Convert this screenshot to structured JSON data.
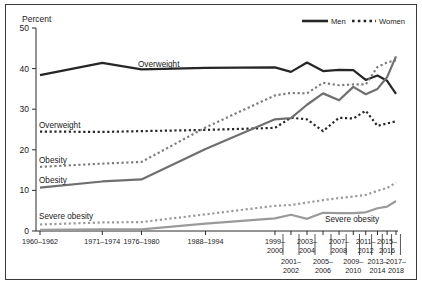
{
  "figure": {
    "y_axis_title": "Percent",
    "legend": [
      {
        "label": "Men",
        "style": "solid",
        "color": "#262626"
      },
      {
        "label": "Women",
        "style": "dotted",
        "color": "#262626"
      }
    ],
    "inline_labels": {
      "men_overweight": "Overweight",
      "women_overweight": "Overweight",
      "women_obesity": "Obesity",
      "men_obesity": "Obesity",
      "women_severe_obesity": "Severe obesity",
      "men_severe_obesity": "Severe obesity"
    }
  },
  "chart_data": {
    "type": "line",
    "title": "",
    "xlabel": "",
    "ylabel": "Percent",
    "ylim": [
      0,
      50
    ],
    "yticks": [
      0,
      10,
      20,
      30,
      40,
      50
    ],
    "grid": false,
    "legend_position": "top-right",
    "categories": [
      "1960–1962",
      "1971–1974",
      "1976–1980",
      "1988–1994",
      "1999–2000",
      "2001–2002",
      "2003–2004",
      "2005–2006",
      "2007–2008",
      "2009–2010",
      "2011–2012",
      "2013–2014",
      "2015–2016",
      "2017–2018"
    ],
    "xtick_labels_top": [
      "1960–1962",
      "1971–1974",
      "1976–1980",
      "1988–1994",
      "1999–2000",
      "2003–2004",
      "2007–2008",
      "2011–2012",
      "2015–2016"
    ],
    "xtick_labels_bottom": [
      "2001–2002",
      "2005–2006",
      "2009–2010",
      "2013–2014",
      "2017–2018"
    ],
    "series": [
      {
        "name": "Men — Overweight",
        "sex": "Men",
        "measure": "Overweight",
        "style": "solid",
        "color": "#262626",
        "values": [
          38.4,
          41.4,
          39.8,
          40.2,
          40.3,
          39.2,
          41.5,
          39.4,
          39.7,
          39.6,
          37.2,
          38.3,
          37.0,
          33.8
        ]
      },
      {
        "name": "Women — Overweight",
        "sex": "Women",
        "measure": "Overweight",
        "style": "dotted",
        "color": "#262626",
        "values": [
          24.5,
          24.4,
          24.6,
          24.9,
          25.4,
          27.9,
          27.5,
          24.6,
          27.9,
          27.7,
          29.6,
          25.9,
          26.5,
          27.0
        ]
      },
      {
        "name": "Women — Obesity",
        "sex": "Women",
        "measure": "Obesity",
        "style": "dotted",
        "color": "#7c7c7c",
        "values": [
          15.8,
          16.6,
          17.0,
          25.5,
          33.4,
          34.0,
          33.9,
          36.5,
          35.9,
          36.1,
          36.1,
          40.4,
          41.5,
          42.1
        ]
      },
      {
        "name": "Men — Obesity",
        "sex": "Men",
        "measure": "Obesity",
        "style": "solid",
        "color": "#6f6f6f",
        "values": [
          10.7,
          12.2,
          12.7,
          20.2,
          27.5,
          27.8,
          31.1,
          33.9,
          32.2,
          35.5,
          33.7,
          35.0,
          37.9,
          43.0
        ]
      },
      {
        "name": "Women — Severe obesity",
        "sex": "Women",
        "measure": "Severe obesity",
        "style": "dotted",
        "color": "#9a9a9a",
        "values": [
          1.6,
          2.1,
          2.2,
          4.1,
          6.2,
          6.4,
          7.0,
          7.6,
          8.1,
          8.5,
          8.9,
          9.9,
          10.6,
          11.9
        ]
      },
      {
        "name": "Men — Severe obesity",
        "sex": "Men",
        "measure": "Severe obesity",
        "style": "solid",
        "color": "#9a9a9a",
        "values": [
          0.3,
          0.4,
          0.4,
          1.8,
          3.1,
          4.0,
          3.0,
          4.5,
          4.4,
          4.4,
          4.6,
          5.6,
          6.0,
          7.4
        ]
      }
    ]
  }
}
